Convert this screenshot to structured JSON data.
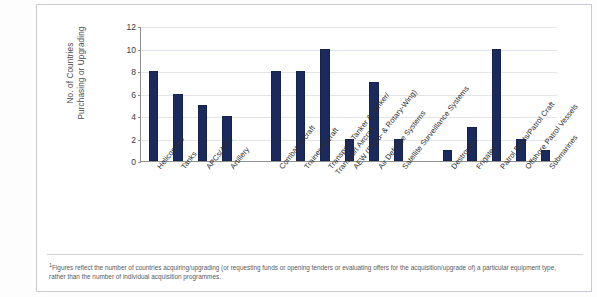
{
  "chart_data": {
    "type": "bar",
    "title": "",
    "subtitle": "",
    "xlabel": "",
    "ylabel_line1": "No. of Countries",
    "ylabel_line2": "Purchasing or Upgrading",
    "ylim": [
      0,
      12
    ],
    "ytick_labels": [
      "0",
      "2",
      "4",
      "6",
      "8",
      "10",
      "12"
    ],
    "ytick_values": [
      0,
      2,
      4,
      6,
      8,
      10,
      12
    ],
    "grid": true,
    "legend": "none",
    "bar_color": "#1b2a5c",
    "categories": [
      "Helicopters",
      "Tanks",
      "APCs/AIFV",
      "Artillery",
      "Combat Aircraft",
      "Trainer Aircraft",
      "Transport, Tanker & Tanker/Transport Aircraft",
      "AEW (Fixed- & Rotary-Wing)",
      "Air Defence Systems",
      "Satellite Surveillance Systems",
      "Destroyers",
      "Frigates",
      "Patrol Boats/Patrol Craft",
      "Offshore Patrol Vessels",
      "Submarines"
    ],
    "category_label_lines": [
      [
        "Helicopters"
      ],
      [
        "Tanks"
      ],
      [
        "APCs/AIFV"
      ],
      [
        "Artillery"
      ],
      [
        "Combat Aircraft"
      ],
      [
        "Trainer Aircraft"
      ],
      [
        "Transport, Tanker & Tanker/",
        "Transport Aircraft"
      ],
      [
        "AEW (Fixed- & Rotary-Wing)"
      ],
      [
        "Air Defence Systems"
      ],
      [
        "Satellite Surveillance Systems"
      ],
      [
        "Destroyers"
      ],
      [
        "Frigates"
      ],
      [
        "Patrol Boats/Patrol Craft"
      ],
      [
        "Offshore Patrol Vessels"
      ],
      [
        "Submarines"
      ]
    ],
    "values": [
      8,
      6,
      5,
      4,
      8,
      8,
      10,
      2,
      7,
      2,
      1,
      3,
      10,
      2,
      1
    ],
    "slot_indices": [
      0,
      1,
      2,
      3,
      5,
      6,
      7,
      8,
      9,
      10,
      12,
      13,
      14,
      15,
      16
    ],
    "slot_count": 17
  },
  "footnote": {
    "marker": "1",
    "text": "Figures reflect the number of countries acquiring/upgrading (or requesting funds or opening tenders or evaluating offers for the acquisition/upgrade of) a particular equipment type, rather than the number of individual acquisition programmes."
  }
}
